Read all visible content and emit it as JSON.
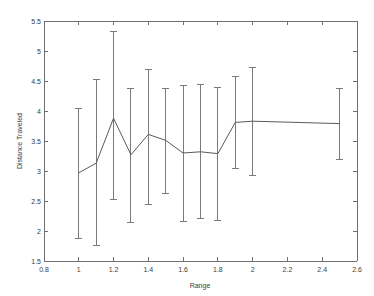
{
  "chart_data": {
    "type": "line",
    "title": "",
    "xlabel": "Range",
    "ylabel": "Distance Traveled",
    "xlim": [
      0.8,
      2.6
    ],
    "ylim": [
      1.5,
      5.5
    ],
    "xticks": [
      0.8,
      1,
      1.2,
      1.4,
      1.6,
      1.8,
      2,
      2.2,
      2.4,
      2.6
    ],
    "xtick_labels": [
      "0.8",
      "1",
      "1.2",
      "1.4",
      "1.6",
      "1.8",
      "2",
      "2.2",
      "2.4",
      "2.6"
    ],
    "yticks": [
      1.5,
      2,
      2.5,
      3,
      3.5,
      4,
      4.5,
      5,
      5.5
    ],
    "ytick_labels": [
      "1.5",
      "2",
      "2.5",
      "3",
      "3.5",
      "4",
      "4.5",
      "5",
      "5.5"
    ],
    "grid": false,
    "legend": false,
    "error_bars": true,
    "line_color": "#5a5a5a",
    "error_color": "#7a7a7a",
    "axis_color": "#6f6f6f",
    "x": [
      1.0,
      1.1,
      1.2,
      1.3,
      1.4,
      1.5,
      1.6,
      1.7,
      1.8,
      1.9,
      2.0,
      2.5
    ],
    "values": [
      2.97,
      3.13,
      3.88,
      3.27,
      3.61,
      3.51,
      3.3,
      3.32,
      3.29,
      3.81,
      3.83,
      3.79
    ],
    "err_low": [
      1.87,
      1.76,
      2.53,
      2.15,
      2.44,
      2.63,
      2.16,
      2.21,
      2.18,
      3.05,
      2.92,
      3.19
    ],
    "err_high": [
      4.05,
      4.53,
      5.33,
      4.38,
      4.7,
      4.38,
      4.43,
      4.44,
      4.39,
      4.58,
      4.73,
      4.37
    ]
  }
}
